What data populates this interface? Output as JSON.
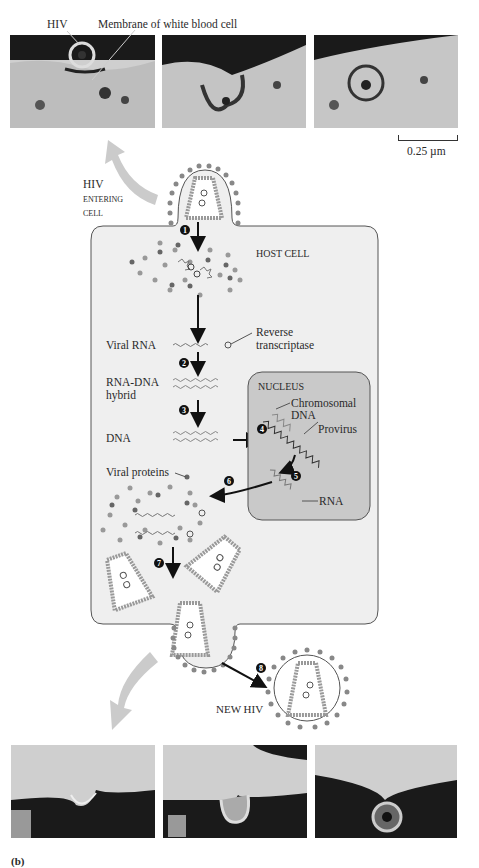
{
  "figure_label": "(b)",
  "top_micrographs": {
    "labels": {
      "hiv": "HIV",
      "membrane": "Membrane of white blood cell"
    },
    "panels": [
      "entry-stage-1",
      "entry-stage-2",
      "entry-stage-3"
    ],
    "scale_bar": "0.25 µm"
  },
  "diagram": {
    "entering_label": [
      "HIV",
      "ENTERING",
      "CELL"
    ],
    "host_cell_label": "HOST CELL",
    "nucleus_label": "NUCLEUS",
    "labels": {
      "viral_rna": "Viral RNA",
      "reverse_transcriptase": [
        "Reverse",
        "transcriptase"
      ],
      "rna_dna_hybrid": [
        "RNA-DNA",
        "hybrid"
      ],
      "dna": "DNA",
      "chromosomal_dna": [
        "Chromosomal",
        "DNA"
      ],
      "provirus": "Provirus",
      "rna": "RNA",
      "viral_proteins": "Viral proteins",
      "new_hiv": "NEW HIV"
    },
    "steps": [
      "1",
      "2",
      "3",
      "4",
      "5",
      "6",
      "7",
      "8"
    ]
  },
  "bottom_micrographs": {
    "panels": [
      "budding-stage-1",
      "budding-stage-2",
      "budding-stage-3"
    ]
  },
  "colors": {
    "cell_fill": "#eeeeee",
    "nucleus_fill": "#c9c9c9",
    "outline": "#555555",
    "dot": "#808080",
    "arrow": "#111111",
    "grey_arrow": "#c8c8c8"
  }
}
